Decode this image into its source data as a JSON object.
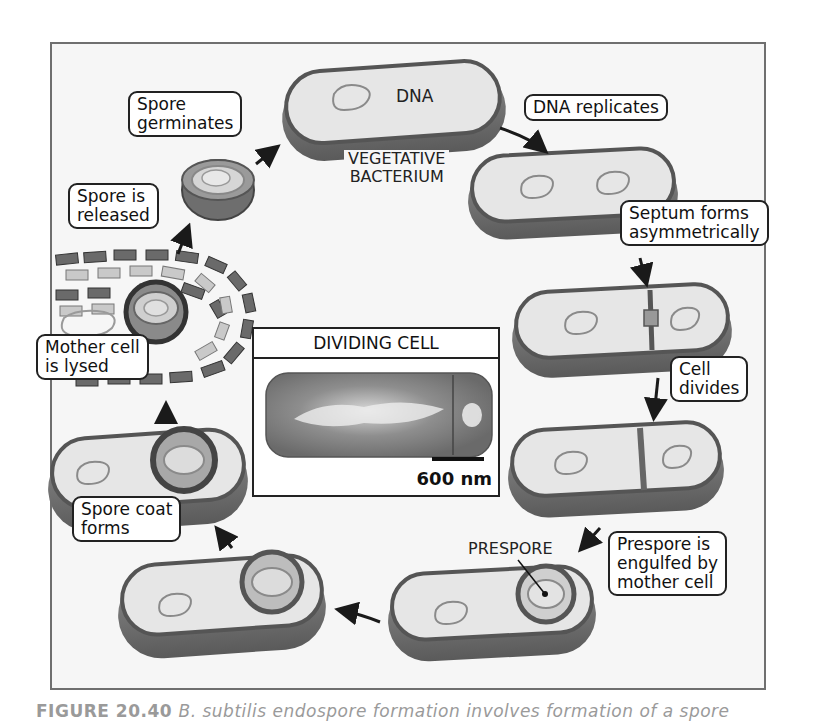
{
  "figure": {
    "caption_label": "FIGURE 20.40",
    "caption_text": "B. subtilis endospore formation involves formation of a spore",
    "colors": {
      "frame_border": "#6f6f6f",
      "background": "#f6f6f6",
      "cell_wall": "#7a7a7a",
      "cytoplasm": "#e4e4e4",
      "label_border": "#222222"
    }
  },
  "stages": {
    "vegetative": {
      "dna_label": "DNA",
      "name_line1": "VEGETATIVE",
      "name_line2": "BACTERIUM"
    },
    "dna_replicates": {
      "label": "DNA replicates"
    },
    "septum": {
      "line1": "Septum forms",
      "line2": "asymmetrically"
    },
    "cell_divides": {
      "line1": "Cell",
      "line2": "divides"
    },
    "engulfed": {
      "line1": "Prespore is",
      "line2": "engulfed by",
      "line3": "mother cell",
      "prespore_label": "PRESPORE"
    },
    "spore_coat": {
      "line1": "Spore coat",
      "line2": "forms"
    },
    "lysed": {
      "line1": "Mother cell",
      "line2": "is lysed"
    },
    "released": {
      "line1": "Spore is",
      "line2": "released"
    },
    "germinates": {
      "line1": "Spore",
      "line2": "germinates"
    }
  },
  "micrograph": {
    "title": "DIVIDING CELL",
    "scale_label": "600 nm"
  }
}
